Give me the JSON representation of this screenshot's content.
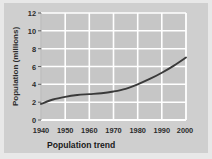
{
  "chart_data": {
    "type": "line",
    "title": "Population trend",
    "xlabel": "",
    "ylabel": "Population (millions)",
    "xlim": [
      1940,
      2000
    ],
    "ylim": [
      0,
      12
    ],
    "grid": true,
    "legend": false,
    "xticks": [
      "1940",
      "1950",
      "1960",
      "1970",
      "1980",
      "1990",
      "2000"
    ],
    "yticks": [
      "0",
      "2",
      "4",
      "6",
      "8",
      "10",
      "12"
    ],
    "series": [
      {
        "name": "Population",
        "x": [
          1940,
          1945,
          1950,
          1955,
          1960,
          1965,
          1970,
          1975,
          1980,
          1985,
          1990,
          1995,
          2000
        ],
        "values": [
          1.8,
          2.3,
          2.6,
          2.8,
          2.9,
          3.0,
          3.2,
          3.5,
          4.0,
          4.6,
          5.3,
          6.1,
          7.0
        ]
      }
    ]
  },
  "colors": {
    "figure_background": "#e8e8e8",
    "plot_background": "#cfcfcf",
    "gridline": "#ffffff",
    "line": "#3a3a3a",
    "text": "#2b2b2b"
  }
}
